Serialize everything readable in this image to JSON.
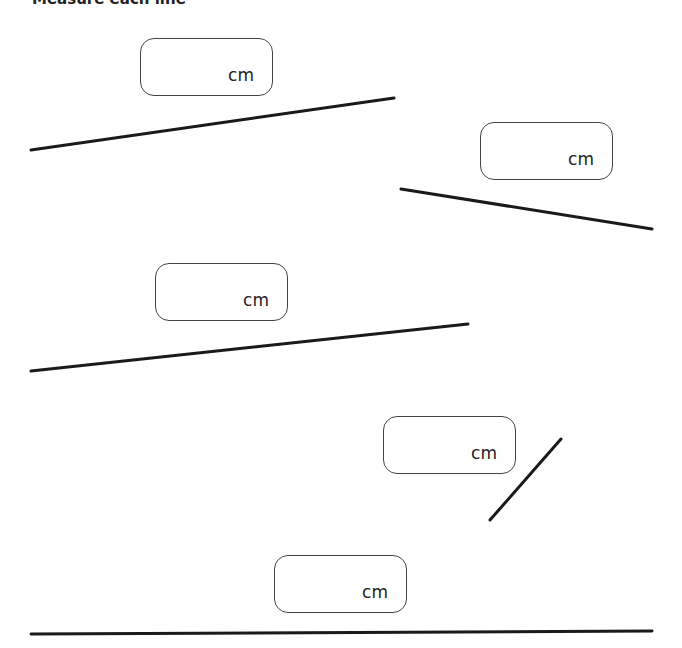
{
  "header": {
    "text": "Measure each line"
  },
  "boxes": [
    {
      "id": 1,
      "unit": "cm",
      "value": ""
    },
    {
      "id": 2,
      "unit": "cm",
      "value": ""
    },
    {
      "id": 3,
      "unit": "cm",
      "value": ""
    },
    {
      "id": 4,
      "unit": "cm",
      "value": ""
    },
    {
      "id": 5,
      "unit": "cm",
      "value": ""
    }
  ],
  "lines": [
    {
      "id": 1,
      "x1": 31,
      "y1": 150,
      "x2": 394,
      "y2": 98
    },
    {
      "id": 2,
      "x1": 401,
      "y1": 189,
      "x2": 652,
      "y2": 229
    },
    {
      "id": 3,
      "x1": 31,
      "y1": 371,
      "x2": 468,
      "y2": 324
    },
    {
      "id": 4,
      "x1": 490,
      "y1": 520,
      "x2": 561,
      "y2": 439
    },
    {
      "id": 5,
      "x1": 31,
      "y1": 634,
      "x2": 652,
      "y2": 631
    }
  ],
  "colors": {
    "line": "#1a1a1a",
    "box_border": "#444444"
  }
}
